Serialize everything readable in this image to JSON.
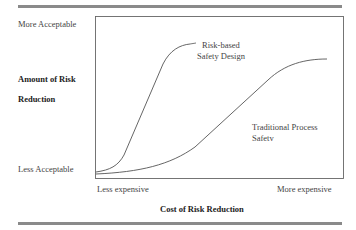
{
  "diagram": {
    "y_axis": {
      "top_label": "More Acceptable",
      "bottom_label": "Less Acceptable",
      "title_line1": "Amount of Risk",
      "title_line2": "Reduction"
    },
    "x_axis": {
      "left_label": "Less expensive",
      "right_label": "More expensive",
      "title": "Cost of Risk Reduction"
    },
    "curves": [
      {
        "name": "risk-based",
        "label_line1": "Risk-based",
        "label_line2": "Safety Design"
      },
      {
        "name": "traditional",
        "label_line1": "Traditional Process",
        "label_line2": "Safetv"
      }
    ],
    "colors": {
      "line": "#555555",
      "rule": "#8a8a8a"
    }
  }
}
